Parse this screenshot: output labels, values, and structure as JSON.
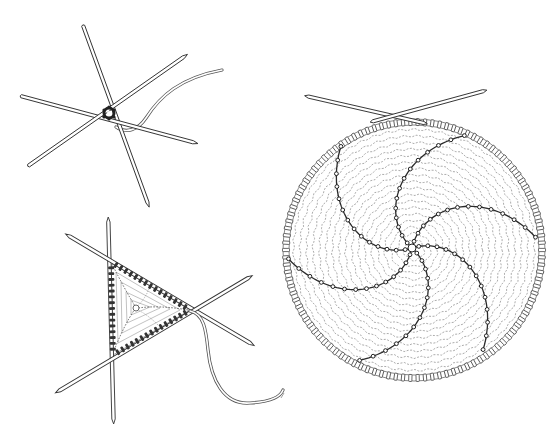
{
  "figures": [
    {
      "id": "cast-on-star",
      "label": "Stitches cast on and divided over four double-pointed needles"
    },
    {
      "id": "triangle-three-needles",
      "label": "Knitting in the round on three double-pointed needles"
    },
    {
      "id": "circular-swirl",
      "label": "Flat circle worked in the round with swirl increase lines"
    }
  ],
  "colors": {
    "ink": "#2a2a2a",
    "background": "#ffffff",
    "stitch_line": "#888888"
  }
}
